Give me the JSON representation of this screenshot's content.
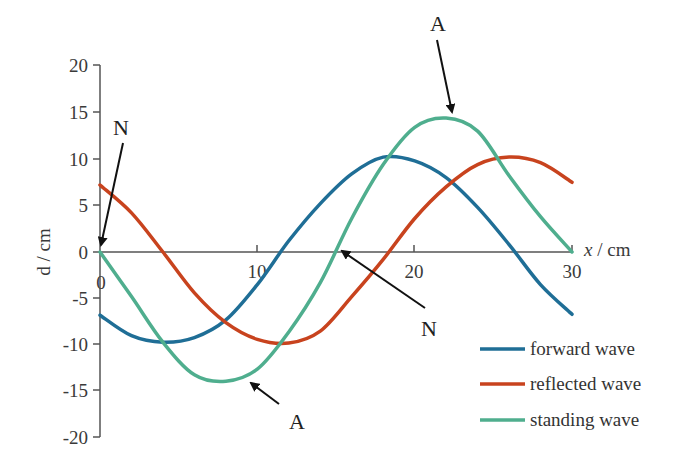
{
  "chart_data": {
    "type": "line",
    "title": "",
    "xlabel": "x / cm",
    "ylabel": "d / cm",
    "xlim": [
      0,
      30
    ],
    "ylim": [
      -20,
      20
    ],
    "grid": false,
    "legend_position": "lower right",
    "x_ticks": [
      "0",
      "10",
      "20",
      "30"
    ],
    "y_ticks": [
      "20",
      "15",
      "10",
      "5",
      "0",
      "-5",
      "-10",
      "-15",
      "-20"
    ],
    "x": [
      0,
      2,
      4,
      6,
      8,
      10,
      12,
      14,
      16,
      18,
      20,
      22,
      24,
      26,
      28,
      30
    ],
    "series": [
      {
        "name": "forward wave",
        "color": "#1f6e96",
        "values": [
          -6.8,
          -9.0,
          -9.7,
          -9.2,
          -7.3,
          -3.5,
          1.2,
          5.2,
          8.4,
          10.2,
          9.8,
          8.0,
          4.8,
          0.8,
          -3.5,
          -6.7
        ]
      },
      {
        "name": "reflected wave",
        "color": "#c8431e",
        "values": [
          7.2,
          4.2,
          0.0,
          -4.4,
          -7.6,
          -9.4,
          -9.8,
          -8.5,
          -4.8,
          -0.8,
          3.6,
          7.0,
          9.4,
          10.2,
          9.6,
          7.5
        ]
      },
      {
        "name": "standing wave",
        "color": "#4fae8e",
        "values": [
          0.0,
          -4.8,
          -9.7,
          -13.2,
          -13.9,
          -12.6,
          -8.6,
          -3.3,
          3.6,
          9.4,
          13.4,
          14.4,
          13.0,
          8.2,
          3.8,
          0.0
        ]
      }
    ],
    "annotations": [
      {
        "text": "N",
        "points_to": [
          0,
          0
        ]
      },
      {
        "text": "A",
        "points_to": [
          22.5,
          14.4
        ]
      },
      {
        "text": "N",
        "points_to": [
          15.1,
          0
        ]
      },
      {
        "text": "A",
        "points_to": [
          9.2,
          -13.7
        ]
      }
    ]
  },
  "axes": {
    "xlabel": "x / cm",
    "ylabel": "d / cm",
    "x_origin_label": "0",
    "x_ticks": [
      {
        "v": 10,
        "label": "10"
      },
      {
        "v": 20,
        "label": "20"
      },
      {
        "v": 30,
        "label": "30"
      }
    ],
    "y_ticks": [
      {
        "v": 20,
        "label": "20"
      },
      {
        "v": 15,
        "label": "15"
      },
      {
        "v": 10,
        "label": "10"
      },
      {
        "v": 5,
        "label": "5"
      },
      {
        "v": 0,
        "label": "0"
      },
      {
        "v": -5,
        "label": "-5"
      },
      {
        "v": -10,
        "label": "-10"
      },
      {
        "v": -15,
        "label": "-15"
      },
      {
        "v": -20,
        "label": "-20"
      }
    ]
  },
  "legend": [
    {
      "label": "forward wave",
      "color": "#1f6e96"
    },
    {
      "label": "reflected wave",
      "color": "#c8431e"
    },
    {
      "label": "standing wave",
      "color": "#4fae8e"
    }
  ],
  "annotations": {
    "n1": "N",
    "a1": "A",
    "n2": "N",
    "a2": "A"
  }
}
